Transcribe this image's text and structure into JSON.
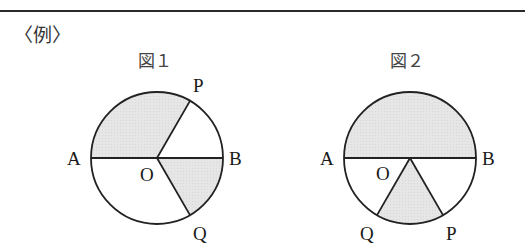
{
  "header": {
    "example_label": "〈例〉"
  },
  "figures": [
    {
      "title": "図１",
      "points": {
        "A": "A",
        "B": "B",
        "O": "O",
        "P": "P",
        "Q": "Q"
      },
      "description": "Circle with diameter AB through center O; radius OP at 60° above OB, radius OQ at 60° below OB; shaded sectors AOP (120°) and BOQ (60°)"
    },
    {
      "title": "図２",
      "points": {
        "A": "A",
        "B": "B",
        "O": "O",
        "P": "P",
        "Q": "Q"
      },
      "description": "Circle with diameter AB through center O; radii OQ and OP below AB forming a 60° angle; shaded upper semicircle and sector QOP"
    }
  ],
  "colors": {
    "shade": "#e4e4e4",
    "stroke": "#222222"
  }
}
